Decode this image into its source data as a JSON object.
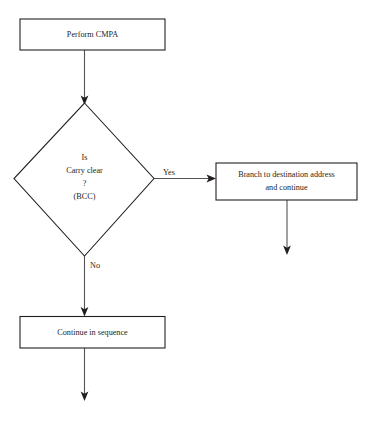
{
  "diagram": {
    "type": "flowchart",
    "colors": {
      "background": "#ffffff",
      "shape_stroke": "#231f20",
      "connector_stroke": "#555355",
      "text": "#231f20"
    },
    "nodes": {
      "perform_cmpa": {
        "shape": "process",
        "label": "Perform CMPA"
      },
      "carry_clear_decision": {
        "shape": "decision",
        "line1": "Is",
        "line2": "Carry clear",
        "line3": "?",
        "line4": "(BCC)"
      },
      "branch_destination": {
        "shape": "process",
        "line1": "Branch to destination address",
        "line2": "and continue"
      },
      "continue_sequence": {
        "shape": "process",
        "label": "Continue in sequence"
      }
    },
    "edges": {
      "yes_label": "Yes",
      "no_label": "No"
    }
  }
}
